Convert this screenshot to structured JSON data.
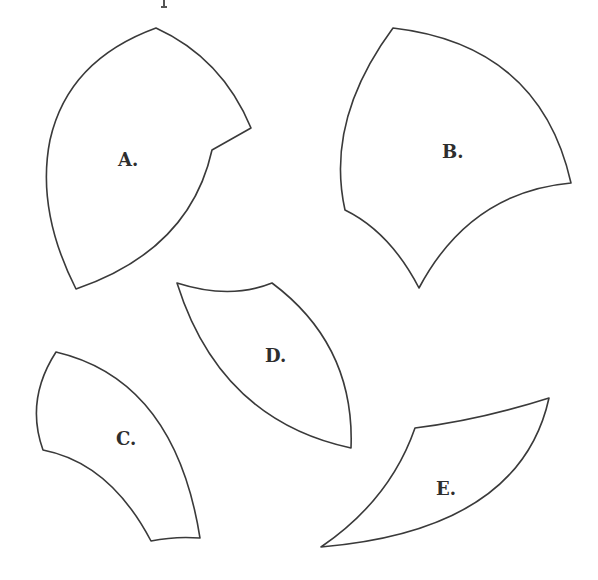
{
  "figure": {
    "shapes": [
      {
        "id": "A",
        "label": "A."
      },
      {
        "id": "B",
        "label": "B."
      },
      {
        "id": "C",
        "label": "C."
      },
      {
        "id": "D",
        "label": "D."
      },
      {
        "id": "E",
        "label": "E."
      }
    ],
    "colors": {
      "outline": "#3a3a3a",
      "fill": "#ffffff",
      "label": "#2e2e2e"
    }
  }
}
